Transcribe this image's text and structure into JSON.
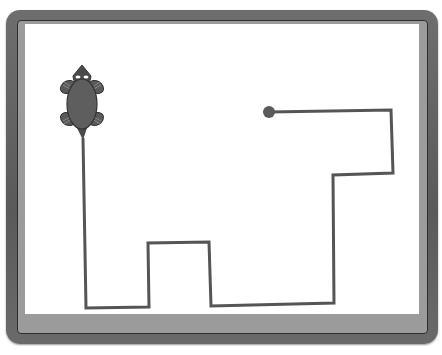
{
  "scene": {
    "description": "Turtle graphics drawing: turtle with traced path inside a gray frame",
    "colors": {
      "frame_outer": "#606060",
      "frame_inner": "#9b9b9b",
      "canvas": "#ffffff",
      "path": "#555555",
      "turtle": "#5a5a5a",
      "end_dot": "#5a5a5a"
    },
    "turtle": {
      "x": 82,
      "y": 102,
      "heading": "down",
      "icon": "turtle-icon"
    },
    "path_points": "83,138 86,308 149,307 148,243 209,242 211,306 334,303 333,175 393,173 391,110 269,112",
    "end_dot": {
      "x": 269,
      "y": 112,
      "r": 6
    }
  }
}
